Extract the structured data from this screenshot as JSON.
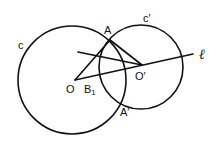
{
  "diagram": {
    "type": "geometry",
    "circles": [
      {
        "name": "c",
        "cx": 72,
        "cy": 80,
        "r": 54,
        "label": "c",
        "label_x": 18,
        "label_y": 49
      },
      {
        "name": "c'",
        "cx": 141,
        "cy": 67,
        "r": 42,
        "label": "c′",
        "label_x": 143,
        "label_y": 22
      }
    ],
    "points": [
      {
        "name": "A",
        "x": 110,
        "y": 40,
        "label": "A",
        "label_x": 104,
        "label_y": 34
      },
      {
        "name": "A'",
        "x": 124,
        "y": 102,
        "label": "A′",
        "label_x": 120,
        "label_y": 116
      },
      {
        "name": "O",
        "x": 75,
        "y": 80,
        "label": "O",
        "label_x": 66,
        "label_y": 93
      },
      {
        "name": "O'",
        "x": 142,
        "y": 65,
        "label": "O′",
        "label_x": 135,
        "label_y": 80
      },
      {
        "name": "B1",
        "x": 85,
        "y": 80,
        "label": "B",
        "sub": "1",
        "label_x": 84,
        "label_y": 93
      }
    ],
    "segments": [
      {
        "name": "line-l",
        "x1": 75,
        "y1": 80,
        "x2": 193,
        "y2": 54
      },
      {
        "name": "segment-line-to-Oprime",
        "x1": 78,
        "y1": 52,
        "x2": 142,
        "y2": 65
      },
      {
        "name": "segment-O-A",
        "x1": 75,
        "y1": 80,
        "x2": 110,
        "y2": 40
      },
      {
        "name": "segment-A-Oprime",
        "x1": 110,
        "y1": 40,
        "x2": 142,
        "y2": 65
      }
    ],
    "line_label": {
      "text": "ℓ",
      "x": 199,
      "y": 59
    }
  }
}
